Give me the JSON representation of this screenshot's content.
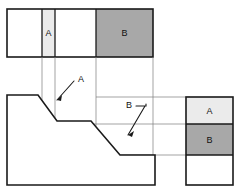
{
  "drawing": {
    "title": "Orthographic projection with sectioned regions A and B",
    "canvas": {
      "width": 240,
      "height": 191
    },
    "colors": {
      "background": "#ffffff",
      "outline": "#1a1a1a",
      "projection_line": "#7d7d7d",
      "leader_line": "#1a1a1a",
      "region_a_fill": "#ebebeb",
      "region_b_fill": "#a8a8a8",
      "plain_fill": "#ffffff",
      "text": "#111111"
    },
    "stroke_widths": {
      "outline": 1.6,
      "projection": 0.7,
      "leader": 1.1,
      "divider": 1.3
    },
    "views": [
      {
        "name": "top-view",
        "label": "Top view",
        "x": 7,
        "y": 9,
        "width": 146,
        "height": 48,
        "segments": [
          {
            "name": "plain-left",
            "x": 7,
            "width": 35,
            "fill": "plain_fill",
            "label": ""
          },
          {
            "name": "region-a",
            "x": 42,
            "width": 13,
            "fill": "region_a_fill",
            "label": "A"
          },
          {
            "name": "plain-middle",
            "x": 55,
            "width": 41,
            "fill": "plain_fill",
            "label": ""
          },
          {
            "name": "region-b",
            "x": 96,
            "width": 57,
            "fill": "region_b_fill",
            "label": "B"
          }
        ]
      },
      {
        "name": "front-view",
        "label": "Front view",
        "outline_points": "7,95 38,95 57,121 91,121 120,155 155,155 155,185 7,185",
        "x": 7,
        "y": 95,
        "width": 148,
        "height": 90
      },
      {
        "name": "side-view",
        "label": "Right side view",
        "x": 186,
        "y": 97,
        "width": 47,
        "height": 88,
        "segments": [
          {
            "name": "region-a",
            "y": 97,
            "height": 27,
            "fill": "region_a_fill",
            "label": "A"
          },
          {
            "name": "region-b",
            "y": 124,
            "height": 31,
            "fill": "region_b_fill",
            "label": "B"
          },
          {
            "name": "plain-bottom",
            "y": 155,
            "height": 30,
            "fill": "plain_fill",
            "label": ""
          }
        ]
      }
    ],
    "projection_lines": {
      "vertical": [
        {
          "name": "proj-v-a-left",
          "x": 42,
          "y1": 57,
          "y2": 100
        },
        {
          "name": "proj-v-a-right",
          "x": 55,
          "y1": 57,
          "y2": 126
        },
        {
          "name": "proj-v-b-left",
          "x": 96,
          "y1": 57,
          "y2": 126
        },
        {
          "name": "proj-v-b-right",
          "x": 153,
          "y1": 57,
          "y2": 160
        }
      ],
      "horizontal": [
        {
          "name": "proj-h-top",
          "y": 97,
          "x1": 96,
          "x2": 190
        },
        {
          "name": "proj-h-mid",
          "y": 124,
          "x1": 55,
          "x2": 190
        },
        {
          "name": "proj-h-bottom",
          "y": 155,
          "x1": 120,
          "x2": 190
        }
      ]
    },
    "leaders": [
      {
        "name": "leader-a",
        "label": "A",
        "label_x": 81,
        "label_y": 80,
        "path": "M 74,81 L 57,100",
        "arrow_points": "57,100 62,95 61,101"
      },
      {
        "name": "leader-b",
        "label": "B",
        "label_x": 129,
        "label_y": 106,
        "path": "M 136,106 L 146,106 L 146,104 M 145,106 L 128,135",
        "arrow_points": "128,135 134,131 132,137"
      }
    ],
    "labels": {
      "region_a": "A",
      "region_b": "B",
      "leader_a": "A",
      "leader_b": "B"
    }
  }
}
